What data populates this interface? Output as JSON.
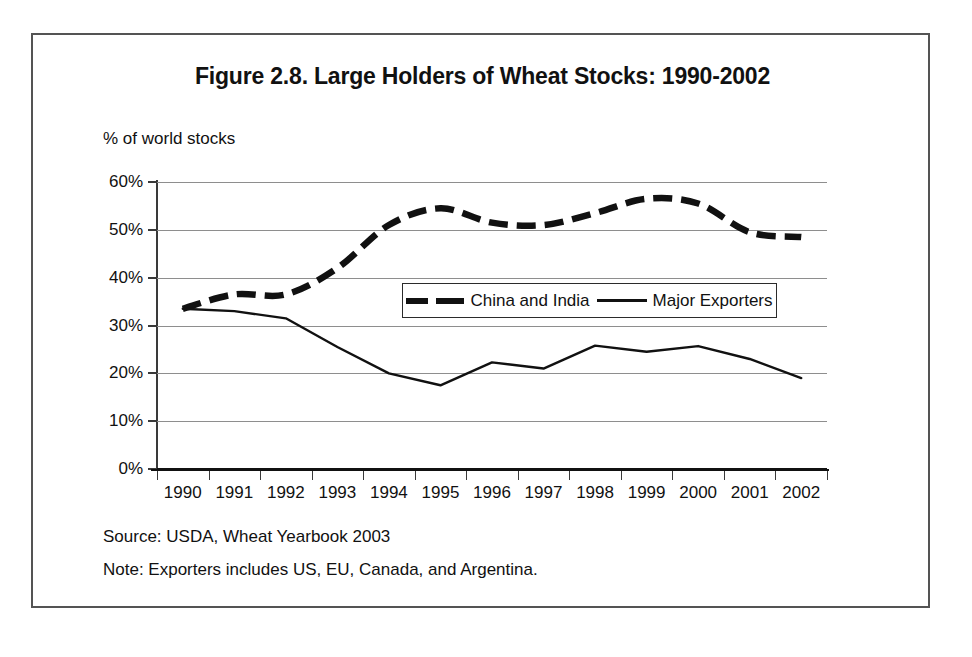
{
  "figure": {
    "title": "Figure 2.8. Large Holders of Wheat Stocks: 1990-2002",
    "axis_note": "% of world stocks",
    "source": "Source: USDA, Wheat Yearbook 2003",
    "note": "Note: Exporters includes US, EU, Canada, and Argentina."
  },
  "legend": {
    "items": [
      {
        "label": "China and India",
        "style": "dashed"
      },
      {
        "label": "Major Exporters",
        "style": "solid"
      }
    ]
  },
  "colors": {
    "line": "#111111",
    "gridline": "#8e8e8e",
    "frame": "#545454",
    "background": "#ffffff"
  },
  "chart_data": {
    "type": "line",
    "title": "Figure 2.8. Large Holders of Wheat Stocks: 1990-2002",
    "xlabel": "",
    "ylabel": "% of world stocks",
    "ylim": [
      0,
      60
    ],
    "ytick_labels": [
      "0%",
      "10%",
      "20%",
      "30%",
      "40%",
      "50%",
      "60%"
    ],
    "ytick_values": [
      0,
      10,
      20,
      30,
      40,
      50,
      60
    ],
    "grid": true,
    "legend_position": "inside-center",
    "categories": [
      "1990",
      "1991",
      "1992",
      "1993",
      "1994",
      "1995",
      "1996",
      "1997",
      "1998",
      "1999",
      "2000",
      "2001",
      "2002"
    ],
    "series": [
      {
        "name": "China and India",
        "style": "dashed",
        "values": [
          33.5,
          36.5,
          36.5,
          42.0,
          51.0,
          54.5,
          51.5,
          51.0,
          53.5,
          56.5,
          55.5,
          49.5,
          48.5
        ]
      },
      {
        "name": "Major Exporters",
        "style": "solid",
        "values": [
          33.5,
          33.0,
          31.5,
          25.5,
          20.0,
          17.5,
          22.3,
          21.0,
          25.8,
          24.5,
          25.7,
          23.0,
          19.0
        ]
      }
    ]
  }
}
